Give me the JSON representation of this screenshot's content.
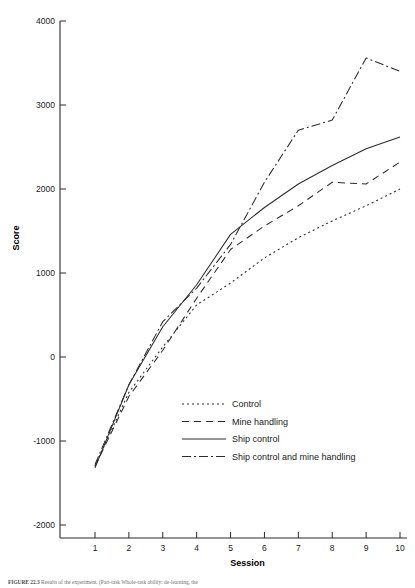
{
  "figure": {
    "caption_label": "FIGURE 22.3",
    "caption_text": "Results of the experiment. (Part-task Whole-task ability: de-learning, the"
  },
  "chart_data": {
    "type": "line",
    "title": "",
    "xlabel": "Session",
    "ylabel": "Score",
    "x": [
      1,
      2,
      3,
      4,
      5,
      6,
      7,
      8,
      9,
      10
    ],
    "xlim": [
      0.6,
      10.4
    ],
    "ylim": [
      -2200,
      4100
    ],
    "yticks": [
      -2000,
      -1000,
      0,
      1000,
      2000,
      3000,
      4000
    ],
    "ytick_labels": [
      "-2000",
      "-1000",
      "0",
      "1000",
      "2000",
      "3000",
      "4000"
    ],
    "xticks": [
      1,
      2,
      3,
      4,
      5,
      6,
      7,
      8,
      9,
      10
    ],
    "xtick_labels": [
      "1",
      "2",
      "3",
      "4",
      "5",
      "6",
      "7",
      "8",
      "9",
      "10"
    ],
    "grid": false,
    "legend_position": "lower-center-right",
    "series": [
      {
        "name": "Control",
        "style": "dotted",
        "dasharray": "2,3",
        "values": [
          -1300,
          -420,
          120,
          620,
          880,
          1180,
          1420,
          1620,
          1800,
          2000
        ]
      },
      {
        "name": "Mine handling",
        "style": "dashed",
        "dasharray": "7,5",
        "values": [
          -1300,
          -470,
          80,
          700,
          1280,
          1560,
          1800,
          2080,
          2060,
          2320
        ]
      },
      {
        "name": "Ship control",
        "style": "solid",
        "dasharray": "none",
        "values": [
          -1320,
          -330,
          360,
          860,
          1460,
          1780,
          2060,
          2280,
          2480,
          2620
        ]
      },
      {
        "name": "Ship control and mine handling",
        "style": "dash-dot",
        "dasharray": "9,3,2,3",
        "values": [
          -1280,
          -330,
          420,
          820,
          1340,
          2080,
          2700,
          2820,
          3560,
          3400
        ]
      }
    ]
  },
  "legend": {
    "items": [
      {
        "label": "Control"
      },
      {
        "label": "Mine handling"
      },
      {
        "label": "Ship control"
      },
      {
        "label": "Ship control and mine handling"
      }
    ]
  }
}
